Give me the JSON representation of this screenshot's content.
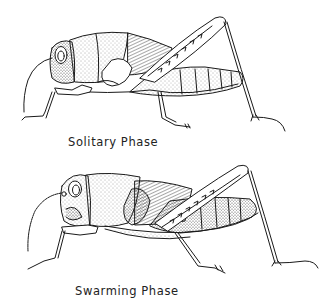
{
  "figures": [
    {
      "label": "Solitary Phase",
      "subject": "locust-side-view"
    },
    {
      "label": "Swarming Phase",
      "subject": "locust-side-view"
    }
  ],
  "colors": {
    "ink": "#1a1a1a",
    "background": "#ffffff",
    "stipple": "#555555"
  }
}
